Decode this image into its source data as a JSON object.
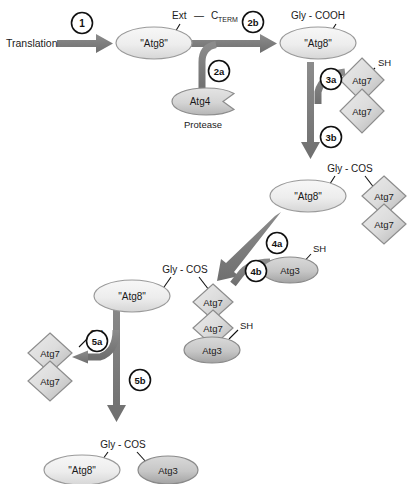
{
  "diagram": {
    "type": "biological-pathway-diagram",
    "background": "#ffffff"
  },
  "colors": {
    "arrow": "#7b7b7b",
    "arrow_dark": "#6e6e6e",
    "atg8_fill_light": "#f2f2f2",
    "atg8_fill_dark": "#d8d8d8",
    "atg8_stroke": "#9a9a9a",
    "atg7_fill_light": "#e2e2e2",
    "atg7_fill_dark": "#b4b4b4",
    "atg7_stroke": "#8d8d8d",
    "atg3_fill_light": "#cfcfcf",
    "atg3_fill_dark": "#a6a6a6",
    "atg3_stroke": "#8a8a8a",
    "atg4_fill_light": "#dcdcdc",
    "atg4_fill_dark": "#bdbdbd",
    "atg4_stroke": "#8d8d8d",
    "text": "#1a1a1a",
    "badge_stroke": "#111111",
    "badge_fill": "#ffffff",
    "tether": "#111111"
  },
  "labels": {
    "translation": "Translation",
    "ext": "Ext",
    "dash": "—",
    "c_base": "C",
    "c_sub": "TERM",
    "gly_cooh": "Gly - COOH",
    "gly_cos": "Gly - COS",
    "protease": "Protease",
    "sh": "SH"
  },
  "nodes": {
    "atg8_1": {
      "label": "\"Atg8\"",
      "kind": "ellipse"
    },
    "atg8_2": {
      "label": "\"Atg8\"",
      "kind": "ellipse"
    },
    "atg8_3": {
      "label": "\"Atg8\"",
      "kind": "ellipse"
    },
    "atg8_4": {
      "label": "\"Atg8\"",
      "kind": "ellipse"
    },
    "atg8_5": {
      "label": "\"Atg8\"",
      "kind": "ellipse"
    },
    "atg4": {
      "label": "Atg4",
      "kind": "pacman-ellipse",
      "caption": "Protease"
    },
    "atg7_a1": {
      "label": "Atg7",
      "kind": "diamond"
    },
    "atg7_a2": {
      "label": "Atg7",
      "kind": "diamond"
    },
    "atg7_b1": {
      "label": "Atg7",
      "kind": "diamond"
    },
    "atg7_b2": {
      "label": "Atg7",
      "kind": "diamond"
    },
    "atg7_c1": {
      "label": "Atg7",
      "kind": "diamond"
    },
    "atg7_c2": {
      "label": "Atg7",
      "kind": "diamond"
    },
    "atg7_d1": {
      "label": "Atg7",
      "kind": "diamond"
    },
    "atg7_d2": {
      "label": "Atg7",
      "kind": "diamond"
    },
    "atg3_1": {
      "label": "Atg3",
      "kind": "ellipse"
    },
    "atg3_2": {
      "label": "Atg3",
      "kind": "ellipse"
    },
    "atg3_3": {
      "label": "Atg3",
      "kind": "ellipse"
    }
  },
  "steps": [
    {
      "id": "1",
      "label": "1"
    },
    {
      "id": "2a",
      "label": "2a"
    },
    {
      "id": "2b",
      "label": "2b"
    },
    {
      "id": "3a",
      "label": "3a"
    },
    {
      "id": "3b",
      "label": "3b"
    },
    {
      "id": "4a",
      "label": "4a"
    },
    {
      "id": "4b",
      "label": "4b"
    },
    {
      "id": "5a",
      "label": "5a"
    },
    {
      "id": "5b",
      "label": "5b"
    }
  ],
  "sh_groups": [
    {
      "id": "sh-atg7-top"
    },
    {
      "id": "sh-atg7-mid"
    },
    {
      "id": "sh-atg3-mid"
    },
    {
      "id": "sh-atg7-left"
    }
  ]
}
